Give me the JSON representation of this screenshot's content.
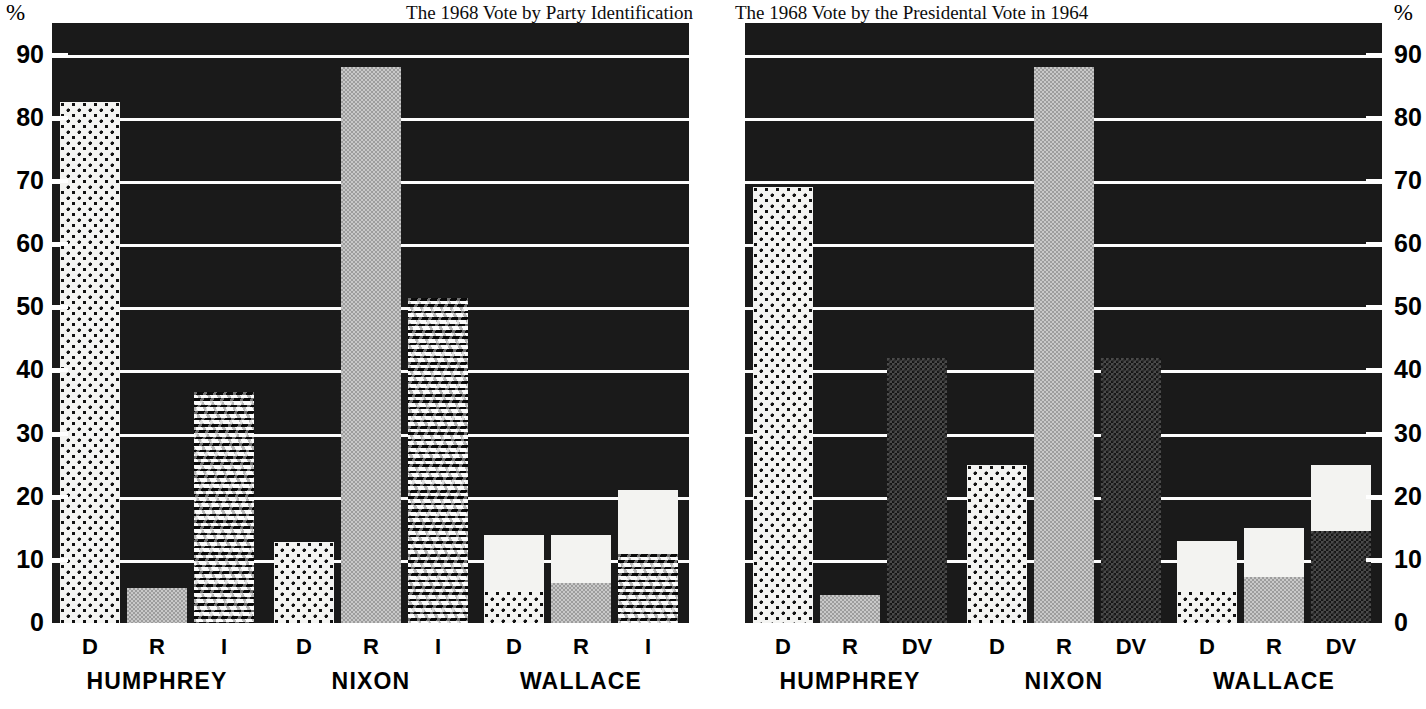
{
  "axis": {
    "percent_symbol": "%",
    "ticks": [
      0,
      10,
      20,
      30,
      40,
      50,
      60,
      70,
      80,
      90
    ],
    "ymin": 0,
    "ymax": 95
  },
  "panels": [
    {
      "id": "left",
      "title": "The 1968 Vote by Party Identification",
      "categories": [
        "D",
        "R",
        "I"
      ],
      "groups": [
        "HUMPHREY",
        "NIXON",
        "WALLACE"
      ]
    },
    {
      "id": "right",
      "title": "The 1968 Vote by the Presidental Vote in 1964",
      "categories": [
        "D",
        "R",
        "DV"
      ],
      "groups": [
        "HUMPHREY",
        "NIXON",
        "WALLACE"
      ]
    }
  ],
  "chart_data": [
    {
      "type": "bar",
      "title": "The 1968 Vote by Party Identification",
      "xlabel": "",
      "ylabel": "%",
      "ylim": [
        0,
        95
      ],
      "grid": true,
      "categories": [
        "HUMPHREY-D",
        "HUMPHREY-R",
        "HUMPHREY-I",
        "NIXON-D",
        "NIXON-R",
        "NIXON-I",
        "WALLACE-D",
        "WALLACE-R",
        "WALLACE-I"
      ],
      "values": [
        82.5,
        5.5,
        36.5,
        12.8,
        88,
        51.5,
        14,
        14,
        21
      ],
      "stacked_extra": [
        0,
        0,
        0,
        0,
        0,
        0,
        5,
        6.3,
        11
      ],
      "bars": [
        {
          "group": "HUMPHREY",
          "cat": "D",
          "value": 82.5,
          "fill": "dot"
        },
        {
          "group": "HUMPHREY",
          "cat": "R",
          "value": 5.5,
          "fill": "gray"
        },
        {
          "group": "HUMPHREY",
          "cat": "I",
          "value": 36.5,
          "fill": "wave"
        },
        {
          "group": "NIXON",
          "cat": "D",
          "value": 12.8,
          "fill": "dot"
        },
        {
          "group": "NIXON",
          "cat": "R",
          "value": 88,
          "fill": "gray"
        },
        {
          "group": "NIXON",
          "cat": "I",
          "value": 51.5,
          "fill": "wave"
        },
        {
          "group": "WALLACE",
          "cat": "D",
          "value": 14,
          "fill": "white",
          "base": 5,
          "base_fill": "dot"
        },
        {
          "group": "WALLACE",
          "cat": "R",
          "value": 14,
          "fill": "white",
          "base": 6.3,
          "base_fill": "gray"
        },
        {
          "group": "WALLACE",
          "cat": "I",
          "value": 21,
          "fill": "white",
          "base": 11,
          "base_fill": "wave"
        }
      ]
    },
    {
      "type": "bar",
      "title": "The 1968 Vote by the Presidental Vote in 1964",
      "xlabel": "",
      "ylabel": "%",
      "ylim": [
        0,
        95
      ],
      "grid": true,
      "categories": [
        "HUMPHREY-D",
        "HUMPHREY-R",
        "HUMPHREY-DV",
        "NIXON-D",
        "NIXON-R",
        "NIXON-DV",
        "WALLACE-D",
        "WALLACE-R",
        "WALLACE-DV"
      ],
      "values": [
        69,
        4.5,
        42,
        25,
        88,
        42,
        13,
        15,
        25
      ],
      "stacked_extra": [
        0,
        0,
        0,
        0,
        0,
        0,
        5,
        7.3,
        14.5
      ],
      "bars": [
        {
          "group": "HUMPHREY",
          "cat": "D",
          "value": 69,
          "fill": "dot"
        },
        {
          "group": "HUMPHREY",
          "cat": "R",
          "value": 4.5,
          "fill": "gray"
        },
        {
          "group": "HUMPHREY",
          "cat": "DV",
          "value": 42,
          "fill": "darkgray"
        },
        {
          "group": "NIXON",
          "cat": "D",
          "value": 25,
          "fill": "dot"
        },
        {
          "group": "NIXON",
          "cat": "R",
          "value": 88,
          "fill": "gray"
        },
        {
          "group": "NIXON",
          "cat": "DV",
          "value": 42,
          "fill": "darkgray"
        },
        {
          "group": "WALLACE",
          "cat": "D",
          "value": 13,
          "fill": "white",
          "base": 5,
          "base_fill": "dot"
        },
        {
          "group": "WALLACE",
          "cat": "R",
          "value": 15,
          "fill": "white",
          "base": 7.3,
          "base_fill": "gray"
        },
        {
          "group": "WALLACE",
          "cat": "DV",
          "value": 25,
          "fill": "white",
          "base": 14.5,
          "base_fill": "darkgray"
        }
      ]
    }
  ],
  "colors": {
    "plot_background": "#1a1a1a",
    "gridline": "#fdfdfd",
    "text": "#000000",
    "gray_fill": "#c9c9c9",
    "dark_gray_fill": "#4a4a4a",
    "white_fill": "#f3f3f1"
  }
}
